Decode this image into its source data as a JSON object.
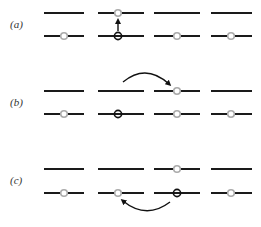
{
  "colors": {
    "line": "#1a1a1a",
    "electron_fill": "#ffffff",
    "electron_stroke": "#aaaaaa",
    "hole_stroke": "#111111",
    "arrow": "#111111"
  },
  "panels": [
    {
      "label": "(a)",
      "label_y": 28,
      "upper_y": 13,
      "lower_y": 36,
      "description": "electron excited vertically from lower to upper level in site 2, leaving a hole",
      "sites": [
        {
          "upper": "empty",
          "lower": "electron"
        },
        {
          "upper": "electron",
          "lower": "hole"
        },
        {
          "upper": "empty",
          "lower": "electron"
        },
        {
          "upper": "empty",
          "lower": "electron"
        }
      ],
      "arrow": {
        "type": "vertical-up",
        "from_site": 2,
        "to_site": 2
      }
    },
    {
      "label": "(b)",
      "label_y": 106,
      "upper_y": 91,
      "lower_y": 114,
      "description": "excited electron hops from site 2 upper level to site 3 upper level",
      "sites": [
        {
          "upper": "empty",
          "lower": "electron"
        },
        {
          "upper": "empty",
          "lower": "hole"
        },
        {
          "upper": "electron",
          "lower": "electron"
        },
        {
          "upper": "empty",
          "lower": "electron"
        }
      ],
      "arrow": {
        "type": "arc-over",
        "from_site": 2,
        "to_site": 3
      }
    },
    {
      "label": "(c)",
      "label_y": 184,
      "upper_y": 169,
      "lower_y": 193,
      "description": "electron from site 3 lower level hops to site 2 lower level filling hole",
      "sites": [
        {
          "upper": "empty",
          "lower": "electron"
        },
        {
          "upper": "empty",
          "lower": "electron"
        },
        {
          "upper": "electron",
          "lower": "hole"
        },
        {
          "upper": "empty",
          "lower": "electron"
        }
      ],
      "arrow": {
        "type": "arc-under",
        "from_site": 3,
        "to_site": 2
      }
    }
  ],
  "site_columns": [
    {
      "x1": 44,
      "x2": 84,
      "cx": 64
    },
    {
      "x1": 98,
      "x2": 144,
      "cx": 118
    },
    {
      "x1": 154,
      "x2": 200,
      "cx": 177
    },
    {
      "x1": 211,
      "x2": 252,
      "cx": 231
    }
  ]
}
